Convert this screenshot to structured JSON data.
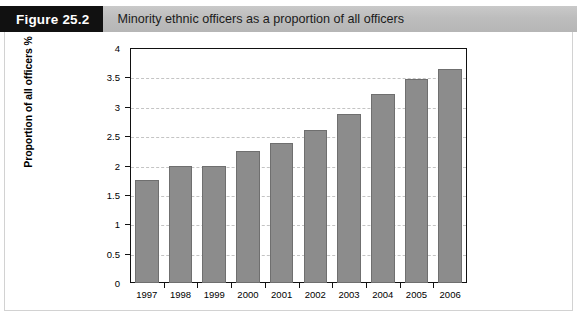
{
  "figure": {
    "tag": "Figure 25.2",
    "caption": "Minority ethnic officers as a proportion of all officers"
  },
  "colors": {
    "bar_fill": "#8c8c8c",
    "bar_edge": "#6f6f6f",
    "axis": "#111111",
    "gridline": "#c4c4c4",
    "header_bar": "#bdbdbd",
    "tag_background": "#111111",
    "tag_text": "#ffffff",
    "panel_border": "#d2d2d2"
  },
  "chart_data": {
    "type": "bar",
    "title": "Minority ethnic officers as a proportion of all officers",
    "xlabel": "",
    "ylabel": "Proportion of all officers %",
    "categories": [
      "1997",
      "1998",
      "1999",
      "2000",
      "2001",
      "2002",
      "2003",
      "2004",
      "2005",
      "2006"
    ],
    "values": [
      1.75,
      2.0,
      2.0,
      2.25,
      2.38,
      2.6,
      2.88,
      3.22,
      3.47,
      3.65
    ],
    "ylim": [
      0,
      4
    ],
    "ytick_labels": [
      "0",
      "0.5",
      "1",
      "1.5",
      "2",
      "2.5",
      "3",
      "3.5",
      "4"
    ],
    "ytick_values": [
      0,
      0.5,
      1,
      1.5,
      2,
      2.5,
      3,
      3.5,
      4
    ],
    "grid": true,
    "grid_axis": "y",
    "legend": null,
    "legend_position": "none"
  }
}
